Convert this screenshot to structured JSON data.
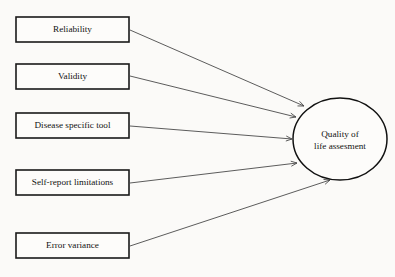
{
  "diagram": {
    "type": "path-diagram",
    "background_color": "#fbfaf8",
    "box_stroke_color": "#1a1a1a",
    "ellipse_stroke_color": "#111111",
    "link_color": "#4a4a4a",
    "text_color": "#121212",
    "predictor_boxes": [
      {
        "id": "reliability",
        "label": "Reliability",
        "x": 16,
        "y": 17,
        "width": 113,
        "height": 25
      },
      {
        "id": "validity",
        "label": "Validity",
        "x": 16,
        "y": 64,
        "width": 113,
        "height": 25
      },
      {
        "id": "disease-specific-tool",
        "label": "Disease specific tool",
        "x": 16,
        "y": 113,
        "width": 113,
        "height": 25
      },
      {
        "id": "self-report-limitations",
        "label": "Self-report limitations",
        "x": 16,
        "y": 170,
        "width": 113,
        "height": 25
      },
      {
        "id": "error-variance",
        "label": "Error variance",
        "x": 16,
        "y": 233,
        "width": 113,
        "height": 25
      }
    ],
    "outcome_node": {
      "id": "quality-of-life-assesment",
      "label_line_1": "Quality of",
      "label_line_2": "life assesment",
      "center_x": 340,
      "center_y": 139,
      "radius_x": 47,
      "radius_y": 41
    },
    "links": [
      {
        "id": "reliability-to-outcome",
        "from": "reliability",
        "to": "quality-of-life-assesment",
        "x1": 130,
        "y1": 30,
        "x2": 304,
        "y2": 106,
        "arrow": "end"
      },
      {
        "id": "validity-to-outcome",
        "from": "validity",
        "to": "quality-of-life-assesment",
        "x1": 130,
        "y1": 76,
        "x2": 296,
        "y2": 117,
        "arrow": "end"
      },
      {
        "id": "disease-specific-tool-to-outcome",
        "from": "disease-specific-tool",
        "to": "quality-of-life-assesment",
        "x1": 130,
        "y1": 126,
        "x2": 292,
        "y2": 139,
        "arrow": "end"
      },
      {
        "id": "self-report-limitations-to-outcome",
        "from": "self-report-limitations",
        "to": "quality-of-life-assesment",
        "x1": 130,
        "y1": 183,
        "x2": 297,
        "y2": 163,
        "arrow": "end"
      },
      {
        "id": "error-variance-to-outcome",
        "from": "error-variance",
        "to": "quality-of-life-assesment",
        "x1": 130,
        "y1": 246,
        "x2": 330,
        "y2": 180,
        "arrow": "end"
      }
    ]
  }
}
